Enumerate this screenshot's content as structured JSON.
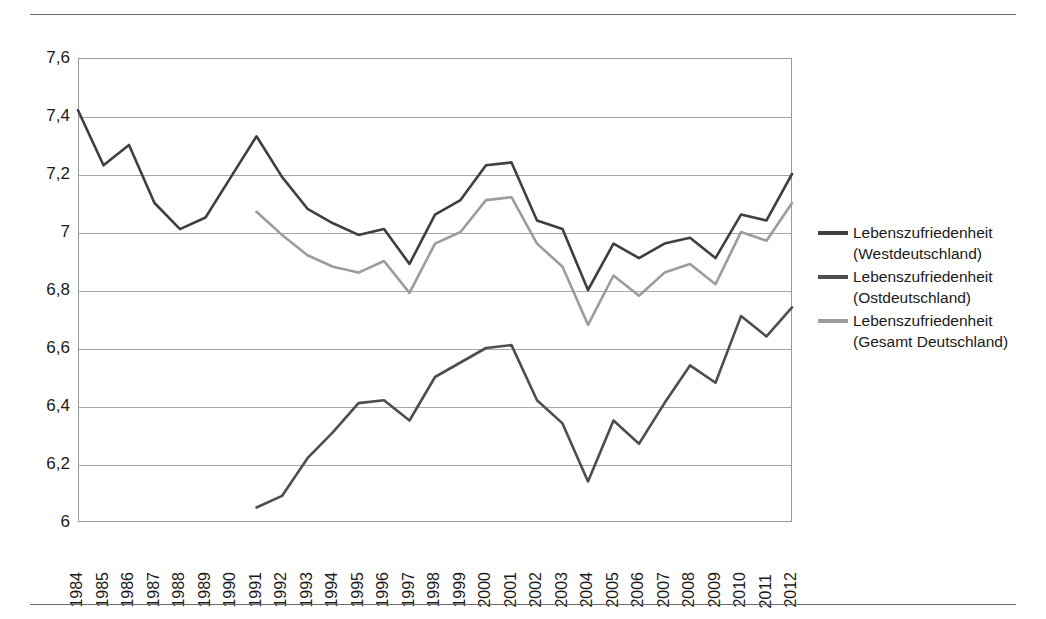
{
  "figure": {
    "background": "#ffffff",
    "top_rule": "horizontal-rule",
    "bottom_rule": "horizontal-rule"
  },
  "legend": {
    "position": "right",
    "items": [
      {
        "label": "Lebenszufriedenheit (Westdeutschland)",
        "color": "#3f3f3f"
      },
      {
        "label": "Lebenszufriedenheit (Ostdeutschland)",
        "color": "#4d4d4d"
      },
      {
        "label": "Lebenszufriedenheit (Gesamt Deutschland)",
        "color": "#9c9c9c"
      }
    ]
  },
  "chart_data": {
    "type": "line",
    "title": "",
    "subtitle": "",
    "xlabel": "",
    "ylabel": "",
    "xlim": [
      1984,
      2012
    ],
    "ylim": [
      6,
      7.6
    ],
    "grid": true,
    "legend_position": "right",
    "ytick_labels": [
      "7,6",
      "7,4",
      "7,2",
      "7",
      "6,8",
      "6,6",
      "6,4",
      "6,2",
      "6"
    ],
    "ytick_values": [
      7.6,
      7.4,
      7.2,
      7.0,
      6.8,
      6.6,
      6.4,
      6.2,
      6.0
    ],
    "categories": [
      "1984",
      "1985",
      "1986",
      "1987",
      "1988",
      "1989",
      "1990",
      "1991",
      "1992",
      "1993",
      "1994",
      "1995",
      "1996",
      "1997",
      "1998",
      "1999",
      "2000",
      "2001",
      "2002",
      "2003",
      "2004",
      "2005",
      "2006",
      "2007",
      "2008",
      "2009",
      "2010",
      "2011",
      "2012"
    ],
    "series": [
      {
        "name": "Lebenszufriedenheit (Westdeutschland)",
        "color": "#3f3f3f",
        "width": 2.6,
        "values": [
          7.42,
          7.23,
          7.3,
          7.1,
          7.01,
          7.05,
          7.19,
          7.33,
          7.19,
          7.08,
          7.03,
          6.99,
          7.01,
          6.89,
          7.06,
          7.11,
          7.23,
          7.24,
          7.04,
          7.01,
          6.8,
          6.96,
          6.91,
          6.96,
          6.98,
          6.91,
          7.06,
          7.04,
          7.2
        ]
      },
      {
        "name": "Lebenszufriedenheit (Ostdeutschland)",
        "color": "#4d4d4d",
        "width": 2.6,
        "values": [
          null,
          null,
          null,
          null,
          null,
          null,
          null,
          6.05,
          6.09,
          6.22,
          6.31,
          6.41,
          6.42,
          6.35,
          6.5,
          6.55,
          6.6,
          6.61,
          6.42,
          6.34,
          6.14,
          6.35,
          6.27,
          6.41,
          6.54,
          6.48,
          6.71,
          6.64,
          6.74
        ]
      },
      {
        "name": "Lebenszufriedenheit (Gesamt Deutschland)",
        "color": "#9c9c9c",
        "width": 2.6,
        "values": [
          null,
          null,
          null,
          null,
          null,
          null,
          null,
          7.07,
          6.99,
          6.92,
          6.88,
          6.86,
          6.9,
          6.79,
          6.96,
          7.0,
          7.11,
          7.12,
          6.96,
          6.88,
          6.68,
          6.85,
          6.78,
          6.86,
          6.89,
          6.82,
          7.0,
          6.97,
          7.1
        ]
      }
    ]
  }
}
